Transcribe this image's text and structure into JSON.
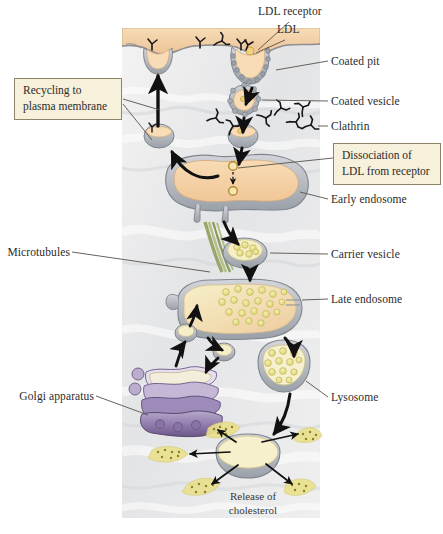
{
  "figure": {
    "canvas": {
      "width": 443,
      "height": 534
    },
    "panel": {
      "x": 122,
      "y": 28,
      "width": 198,
      "height": 490,
      "cytosol_color": "#e9e9e9",
      "extracellular_color": "#f2cfa1"
    }
  },
  "callouts": [
    {
      "id": "recycling",
      "text_line1": "Recycling to",
      "text_line2": "plasma membrane"
    },
    {
      "id": "dissociation",
      "text_line1": "Dissociation of",
      "text_line2": "LDL from receptor"
    }
  ],
  "labels_right": [
    {
      "id": "coated-pit",
      "text": "Coated pit"
    },
    {
      "id": "coated-vesicle",
      "text": "Coated vesicle"
    },
    {
      "id": "clathrin",
      "text": "Clathrin"
    },
    {
      "id": "early-endosome",
      "text": "Early endosome"
    },
    {
      "id": "carrier-vesicle",
      "text": "Carrier vesicle"
    },
    {
      "id": "late-endosome",
      "text": "Late endosome"
    },
    {
      "id": "lysosome",
      "text": "Lysosome"
    }
  ],
  "labels_top": [
    {
      "id": "ldl-receptor",
      "text": "LDL receptor"
    },
    {
      "id": "ldl",
      "text": "LDL"
    }
  ],
  "labels_left": [
    {
      "id": "microtubules",
      "text": "Microtubules"
    },
    {
      "id": "golgi-apparatus",
      "text": "Golgi apparatus"
    }
  ],
  "labels_inside": [
    {
      "id": "release-of-cholesterol",
      "line1": "Release of",
      "line2": "cholesterol"
    }
  ],
  "colors": {
    "membrane_tan": "#f2cfa1",
    "lumen_tan": "#f5d4a8",
    "cytosol_gray": "#eceded",
    "organelle_gray": "#b9bcc2",
    "golgi_purple": "#7e6a9e",
    "golgi_light": "#d8d2e4",
    "cholesterol_yellow": "#e8e28a",
    "vesicle_cream": "#f3ecc4",
    "microtubule_green": "#9ba86a",
    "arrow_black": "#111111",
    "callout_fill": "#f7f0da",
    "callout_border": "#8d8468",
    "leader_line": "#55524a"
  }
}
